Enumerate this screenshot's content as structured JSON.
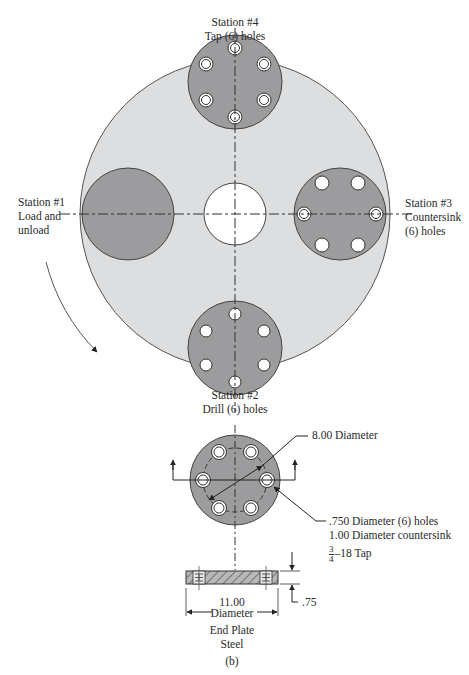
{
  "figure": {
    "stations": [
      {
        "id": "station-4",
        "title": "Station #4",
        "desc": [
          "Tap (6) holes"
        ]
      },
      {
        "id": "station-1",
        "title": "Station #1",
        "desc": [
          "Load and",
          "unload"
        ]
      },
      {
        "id": "station-3",
        "title": "Station #3",
        "desc": [
          "Countersink",
          "(6) holes"
        ]
      },
      {
        "id": "station-2",
        "title": "Station #2",
        "desc": [
          "Drill (6) holes"
        ]
      }
    ],
    "end_plate": {
      "bolt_circle_label": "8.00 Diameter",
      "hole_spec_lines": [
        ".750 Diameter (6) holes",
        "1.00 Diameter countersink"
      ],
      "tap_fraction_num": "3",
      "tap_fraction_den": "4",
      "tap_suffix": "–18 Tap",
      "thickness_label": ".75",
      "outer_diameter_value": "11.00",
      "outer_diameter_word": "Diameter",
      "name": "End Plate",
      "material": "Steel",
      "caption": "(b)"
    },
    "colors": {
      "table_fill": "#dcdee0",
      "station_fill": "#9c9c9e",
      "hole_fill": "#ffffff",
      "outline": "#444444"
    }
  }
}
